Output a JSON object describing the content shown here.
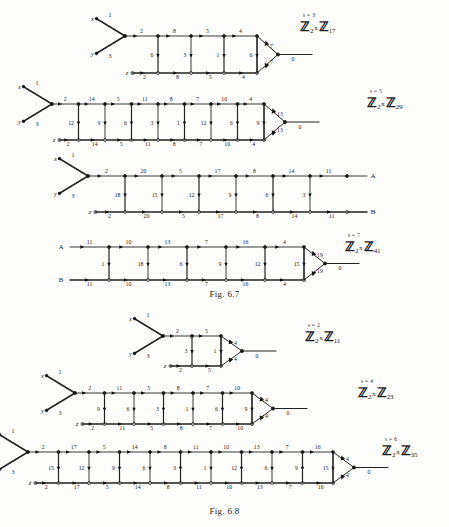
{
  "page": {
    "figures": [
      {
        "id": "fig-6-7",
        "caption": "Fig. 6.7",
        "diagrams": [
          {
            "id": "s3",
            "s_label": "s = 3",
            "group": {
              "prefix": "Z",
              "sub1": "2",
              "times": "x",
              "letter2": "Z",
              "sub2": "17"
            },
            "inputs": [
              {
                "name": "x",
                "weight": "1"
              },
              {
                "name": "y",
                "weight": "3"
              },
              {
                "name": "z",
                "weight": ""
              }
            ],
            "top_labels": [
              "2",
              "8",
              "5",
              "4"
            ],
            "bottom_labels": [
              "2",
              "8",
              "5",
              "4"
            ],
            "rung_labels": [
              "6",
              "3",
              "1",
              "6"
            ],
            "triangle_labels": [
              "7",
              "7"
            ],
            "output_label": "0"
          },
          {
            "id": "s5",
            "s_label": "s = 5",
            "group": {
              "prefix": "Z",
              "sub1": "2",
              "times": "x",
              "letter2": "Z",
              "sub2": "29"
            },
            "inputs": [
              {
                "name": "x",
                "weight": "1"
              },
              {
                "name": "y",
                "weight": "3"
              },
              {
                "name": "z",
                "weight": ""
              }
            ],
            "top_labels": [
              "2",
              "14",
              "5",
              "11",
              "8",
              "7",
              "10",
              "4"
            ],
            "bottom_labels": [
              "2",
              "14",
              "5",
              "11",
              "8",
              "7",
              "10",
              "4"
            ],
            "rung_labels": [
              "12",
              "9",
              "6",
              "3",
              "1",
              "12",
              "6",
              "9"
            ],
            "triangle_labels": [
              "13",
              "13"
            ],
            "output_label": "0"
          },
          {
            "id": "s7a",
            "s_label": "",
            "group": null,
            "inputs": [
              {
                "name": "x",
                "weight": "1"
              },
              {
                "name": "y",
                "weight": "3"
              },
              {
                "name": "z",
                "weight": ""
              }
            ],
            "top_labels": [
              "2",
              "20",
              "5",
              "17",
              "8",
              "14",
              "11"
            ],
            "bottom_labels": [
              "2",
              "20",
              "5",
              "17",
              "8",
              "14",
              "11"
            ],
            "rung_labels": [
              "18",
              "15",
              "12",
              "9",
              "6",
              "3"
            ],
            "end_top": "A",
            "end_bottom": "B",
            "triangle_labels": [],
            "output_label": ""
          },
          {
            "id": "s7b",
            "s_label": "s = 7",
            "group": {
              "prefix": "Z",
              "sub1": "2",
              "times": "x",
              "letter2": "Z",
              "sub2": "41"
            },
            "inputs": [
              {
                "name": "A",
                "weight": ""
              },
              {
                "name": "B",
                "weight": ""
              }
            ],
            "top_labels": [
              "11",
              "10",
              "13",
              "7",
              "16",
              "4"
            ],
            "bottom_labels": [
              "11",
              "10",
              "13",
              "7",
              "16",
              "4"
            ],
            "rung_labels": [
              "1",
              "18",
              "6",
              "9",
              "12",
              "15"
            ],
            "triangle_labels": [
              "19",
              "19"
            ],
            "output_label": "0"
          }
        ]
      },
      {
        "id": "fig-6-8",
        "caption": "Fig. 6.8",
        "diagrams": [
          {
            "id": "s2",
            "s_label": "s = 2",
            "group": {
              "prefix": "Z",
              "sub1": "2",
              "times": "x",
              "letter2": "Z",
              "sub2": "11"
            },
            "inputs": [
              {
                "name": "x",
                "weight": "1"
              },
              {
                "name": "y",
                "weight": "3"
              },
              {
                "name": "z",
                "weight": ""
              }
            ],
            "top_labels": [
              "2",
              "5"
            ],
            "bottom_labels": [
              "2",
              "5"
            ],
            "rung_labels": [
              "3",
              "1"
            ],
            "triangle_labels": [
              "4",
              "4"
            ],
            "output_label": "0"
          },
          {
            "id": "s4",
            "s_label": "s = 4",
            "group": {
              "prefix": "Z",
              "sub1": "2",
              "times": "x",
              "letter2": "Z",
              "sub2": "23"
            },
            "inputs": [
              {
                "name": "x",
                "weight": "1"
              },
              {
                "name": "y",
                "weight": "3"
              },
              {
                "name": "z",
                "weight": ""
              }
            ],
            "top_labels": [
              "2",
              "11",
              "5",
              "8",
              "7",
              "10"
            ],
            "bottom_labels": [
              "2",
              "11",
              "5",
              "8",
              "7",
              "10"
            ],
            "rung_labels": [
              "9",
              "6",
              "3",
              "1",
              "6",
              "9"
            ],
            "triangle_labels": [
              "4",
              "4"
            ],
            "output_label": "0"
          },
          {
            "id": "s6",
            "s_label": "s = 6",
            "group": {
              "prefix": "Z",
              "sub1": "2",
              "times": "x",
              "letter2": "Z",
              "sub2": "35"
            },
            "inputs": [
              {
                "name": "x",
                "weight": "1"
              },
              {
                "name": "y",
                "weight": "3"
              },
              {
                "name": "z",
                "weight": ""
              }
            ],
            "top_labels": [
              "2",
              "17",
              "5",
              "14",
              "8",
              "11",
              "10",
              "13",
              "7",
              "16"
            ],
            "bottom_labels": [
              "2",
              "17",
              "5",
              "14",
              "8",
              "11",
              "10",
              "13",
              "7",
              "16"
            ],
            "rung_labels": [
              "15",
              "12",
              "9",
              "6",
              "3",
              "1",
              "12",
              "6",
              "9",
              "15"
            ],
            "triangle_labels": [
              "4",
              "4"
            ],
            "output_label": "0"
          }
        ]
      }
    ]
  }
}
